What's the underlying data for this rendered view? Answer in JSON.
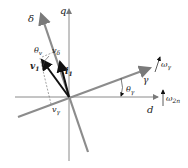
{
  "diagram": {
    "type": "vector-phasor-diagram",
    "colors": {
      "axis": "#8a8a8a",
      "frame": "#8c8c8c",
      "vector": "#111111",
      "dashed": "#666666",
      "text": "#222222"
    },
    "labels": {
      "q_axis": "q",
      "d_axis": "d",
      "delta_axis": "δ",
      "gamma_axis": "γ",
      "v1_vector": "v",
      "v1_sub": "1",
      "i1_vector": "i",
      "i1_sub": "1",
      "theta_v": "θ",
      "theta_v_sub": "v",
      "theta_gamma": "θ",
      "theta_gamma_sub": "γ",
      "v_delta": "v",
      "v_delta_sub": "δ",
      "v_gamma": "v",
      "v_gamma_sub": "γ",
      "omega_gamma": "ω",
      "omega_gamma_sub": "γ",
      "omega_2n": "ω",
      "omega_2n_sub": "2n"
    }
  }
}
